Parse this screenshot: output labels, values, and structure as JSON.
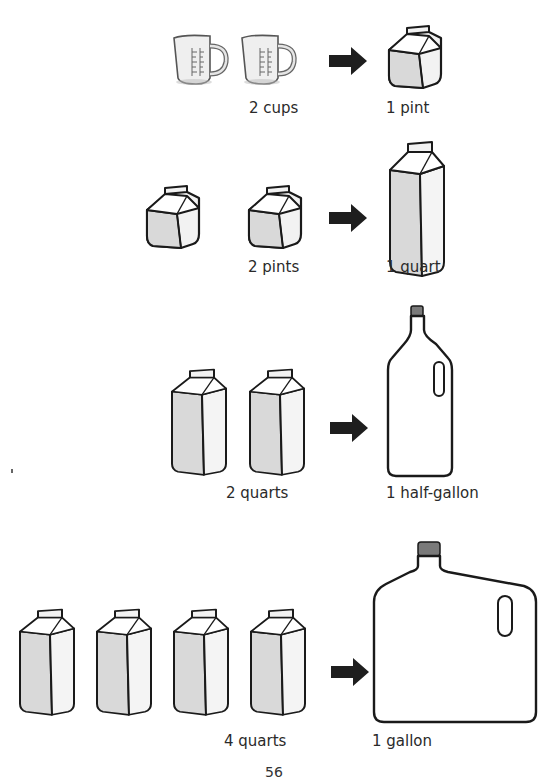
{
  "page": {
    "page_number": "56"
  },
  "rows": [
    {
      "left_label": "2 cups",
      "right_label": "1 pint",
      "left_icon": "measuring-cup-icon",
      "left_count": 2,
      "right_icon": "pint-carton-icon"
    },
    {
      "left_label": "2 pints",
      "right_label": "1 quart",
      "left_icon": "pint-carton-icon",
      "left_count": 2,
      "right_icon": "quart-carton-icon"
    },
    {
      "left_label": "2 quarts",
      "right_label": "1 half-gallon",
      "left_icon": "quart-carton-icon",
      "left_count": 2,
      "right_icon": "half-gallon-bottle-icon"
    },
    {
      "left_label": "4 quarts",
      "right_label": "1 gallon",
      "left_icon": "quart-carton-icon",
      "left_count": 4,
      "right_icon": "gallon-jug-icon"
    }
  ],
  "colors": {
    "outline": "#1a1a1a",
    "carton_front": "#d9d9d9",
    "carton_side": "#f2f2f2",
    "arrow": "#1e1e1e",
    "cap": "#7a7a7a"
  }
}
